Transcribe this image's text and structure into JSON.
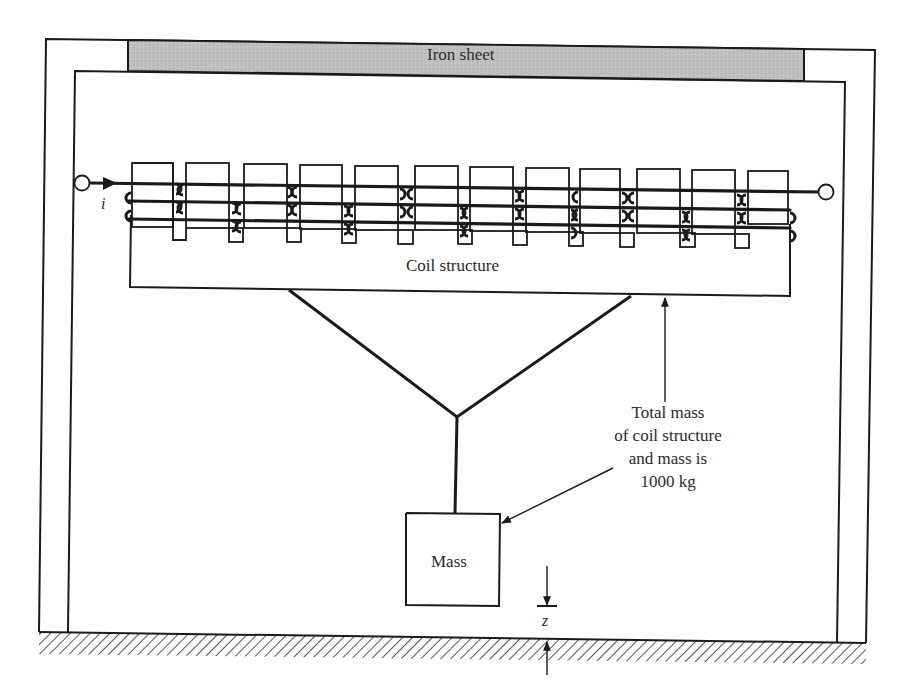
{
  "diagram": {
    "type": "electromechanical schematic",
    "labels": {
      "iron_sheet": "Iron sheet",
      "coil_structure": "Coil structure",
      "mass": "Mass",
      "current_symbol": "i",
      "gap_symbol": "z",
      "note_lines": [
        "Total mass",
        "of coil structure",
        "and mass is",
        "1000 kg"
      ]
    },
    "values": {
      "total_mass": "1000 kg",
      "coil_count": 12,
      "winding_turns_per_coil": 3
    },
    "colors": {
      "ink": "#1a1a1a",
      "iron_fill": "#bdbdbd",
      "background": "#ffffff"
    }
  }
}
